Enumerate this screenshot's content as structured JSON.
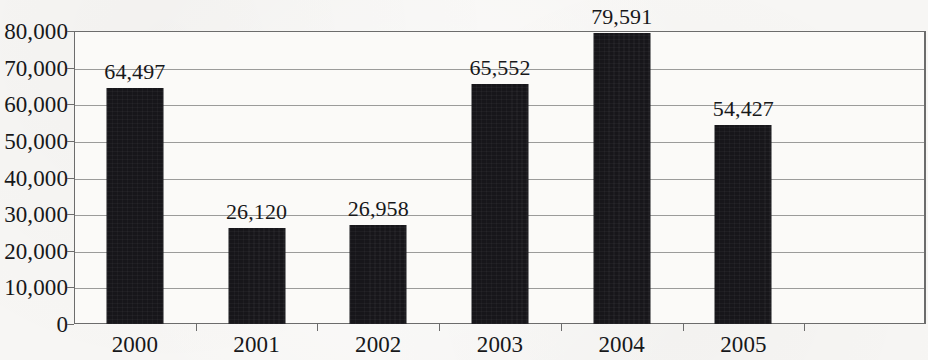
{
  "chart_data": {
    "type": "bar",
    "title": "",
    "subtitle": "",
    "xlabel": "",
    "ylabel": "",
    "categories": [
      "2000",
      "2001",
      "2002",
      "2003",
      "2004",
      "2005"
    ],
    "values": [
      64497,
      26120,
      26958,
      65552,
      79591,
      54427
    ],
    "value_labels": [
      "64,497",
      "26,120",
      "26,958",
      "65,552",
      "79,591",
      "54,427"
    ],
    "ylim": [
      0,
      80000
    ],
    "ytick_values": [
      0,
      10000,
      20000,
      30000,
      40000,
      50000,
      60000,
      70000,
      80000
    ],
    "ytick_labels": [
      "0",
      "10,000",
      "20,000",
      "30,000",
      "40,000",
      "50,000",
      "60,000",
      "70,000",
      "80,000"
    ],
    "grid": true,
    "legend": null,
    "legend_position": "none",
    "bar_color": "#17161a",
    "gridline_color": "#8a8a8a",
    "axis_color": "#6c6c6c",
    "plot_background": "#fbfaf8",
    "page_background": "#f7f6f4",
    "category_slots": 7,
    "empty_trailing_slots": 1,
    "data_labels_shown": true
  }
}
